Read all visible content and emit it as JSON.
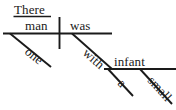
{
  "diagram": {
    "kind": "reed-kellogg-sentence-diagram",
    "sentence": "There was one man with a small infant",
    "ink_color": "#1a1a1a",
    "background_color": "#ffffff",
    "expletive": {
      "word": "There",
      "underlined": true
    },
    "main_clause": {
      "subject": "man",
      "verb": "was",
      "subject_modifier": "one"
    },
    "prepositional_phrase": {
      "preposition": "with",
      "object": "infant",
      "object_modifiers": [
        "a",
        "small"
      ]
    },
    "words": {
      "there": "There",
      "man": "man",
      "was": "was",
      "one": "one",
      "with": "with",
      "infant": "infant",
      "a": "a",
      "small": "small"
    }
  }
}
